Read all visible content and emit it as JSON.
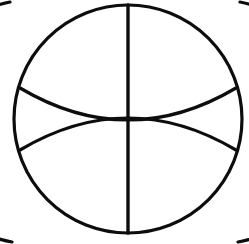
{
  "figure": {
    "background_color": "#ffffff",
    "stroke_color": "#0d0d0d",
    "canvas": {
      "width": 249,
      "height": 244
    },
    "geometry": {
      "circle": {
        "cx": 128,
        "cy": 119,
        "r": 114,
        "stroke_width": 3.2
      },
      "left_arc": {
        "center_x": 14,
        "center_y": 119,
        "radius": 114,
        "start_x": 10,
        "start_y": 2,
        "end_x": 12,
        "end_y": 242,
        "stroke_width": 3.2
      },
      "right_arc": {
        "center_x": 242,
        "center_y": 119,
        "radius": 114,
        "start_x": 240,
        "start_y": 2,
        "end_x": 238,
        "end_y": 242,
        "stroke_width": 3.2
      },
      "vertical_line": {
        "x": 128,
        "y1": 5,
        "y2": 233,
        "stroke_width": 3.4
      },
      "upper_lens_lower_arc": {
        "start_x": 20,
        "start_y": 88,
        "ctrl_x": 128,
        "ctrl_y": 152,
        "end_x": 236,
        "end_y": 88,
        "stroke_width": 3.2
      },
      "lower_lens_upper_arc": {
        "start_x": 20,
        "start_y": 150,
        "ctrl_x": 128,
        "ctrl_y": 86,
        "end_x": 236,
        "end_y": 150,
        "stroke_width": 3.2
      },
      "intersections": [
        {
          "name": "top-left-crossing",
          "x": 32,
          "y": 61
        },
        {
          "name": "top-right-crossing",
          "x": 216,
          "y": 61
        },
        {
          "name": "bottom-left-crossing",
          "x": 32,
          "y": 176
        },
        {
          "name": "bottom-right-crossing",
          "x": 216,
          "y": 176
        },
        {
          "name": "top-vertex",
          "x": 128,
          "y": 5
        },
        {
          "name": "center-vertex",
          "x": 128,
          "y": 119
        },
        {
          "name": "bottom-vertex",
          "x": 128,
          "y": 233
        }
      ]
    }
  }
}
